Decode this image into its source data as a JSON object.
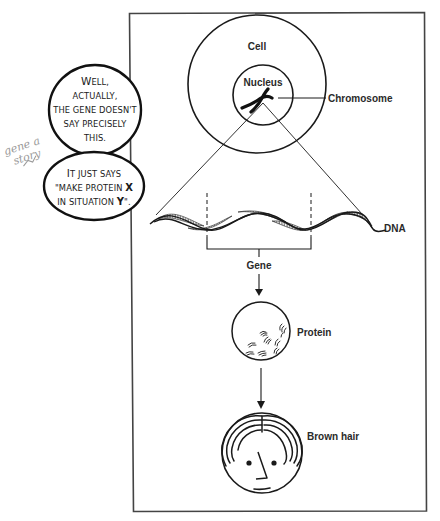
{
  "diagram": {
    "labels": {
      "cell": "Cell",
      "nucleus": "Nucleus",
      "chromosome": "Chromosome",
      "dna": "DNA",
      "gene": "Gene",
      "protein": "Protein",
      "trait": "Brown hair"
    },
    "flow": [
      "Cell",
      "Nucleus",
      "Chromosome",
      "DNA",
      "Gene",
      "Protein",
      "Brown hair"
    ],
    "colors": {
      "line": "#1a1a1a",
      "frame": "#444444",
      "label": "#2a2a2a",
      "scribble": "#9a9a9a",
      "background": "#ffffff"
    }
  },
  "speech_bubbles": [
    {
      "lines": [
        "WELL,",
        "ACTUALLY,",
        "THE GENE DOESN'T",
        "SAY PRECISELY",
        "THIS."
      ],
      "line_0_cap": "W",
      "line_0_rest": "ELL,"
    },
    {
      "line_0_cap": "I",
      "line_0_rest": "T JUST SAYS",
      "line_1_a": "\"MAKE PROTEIN ",
      "line_1_b": "X",
      "line_2_a": "IN SITUATION ",
      "line_2_b": "Y",
      "line_2_c": "\"."
    }
  ],
  "handwriting": {
    "line1": "gene a",
    "line2": "story"
  }
}
